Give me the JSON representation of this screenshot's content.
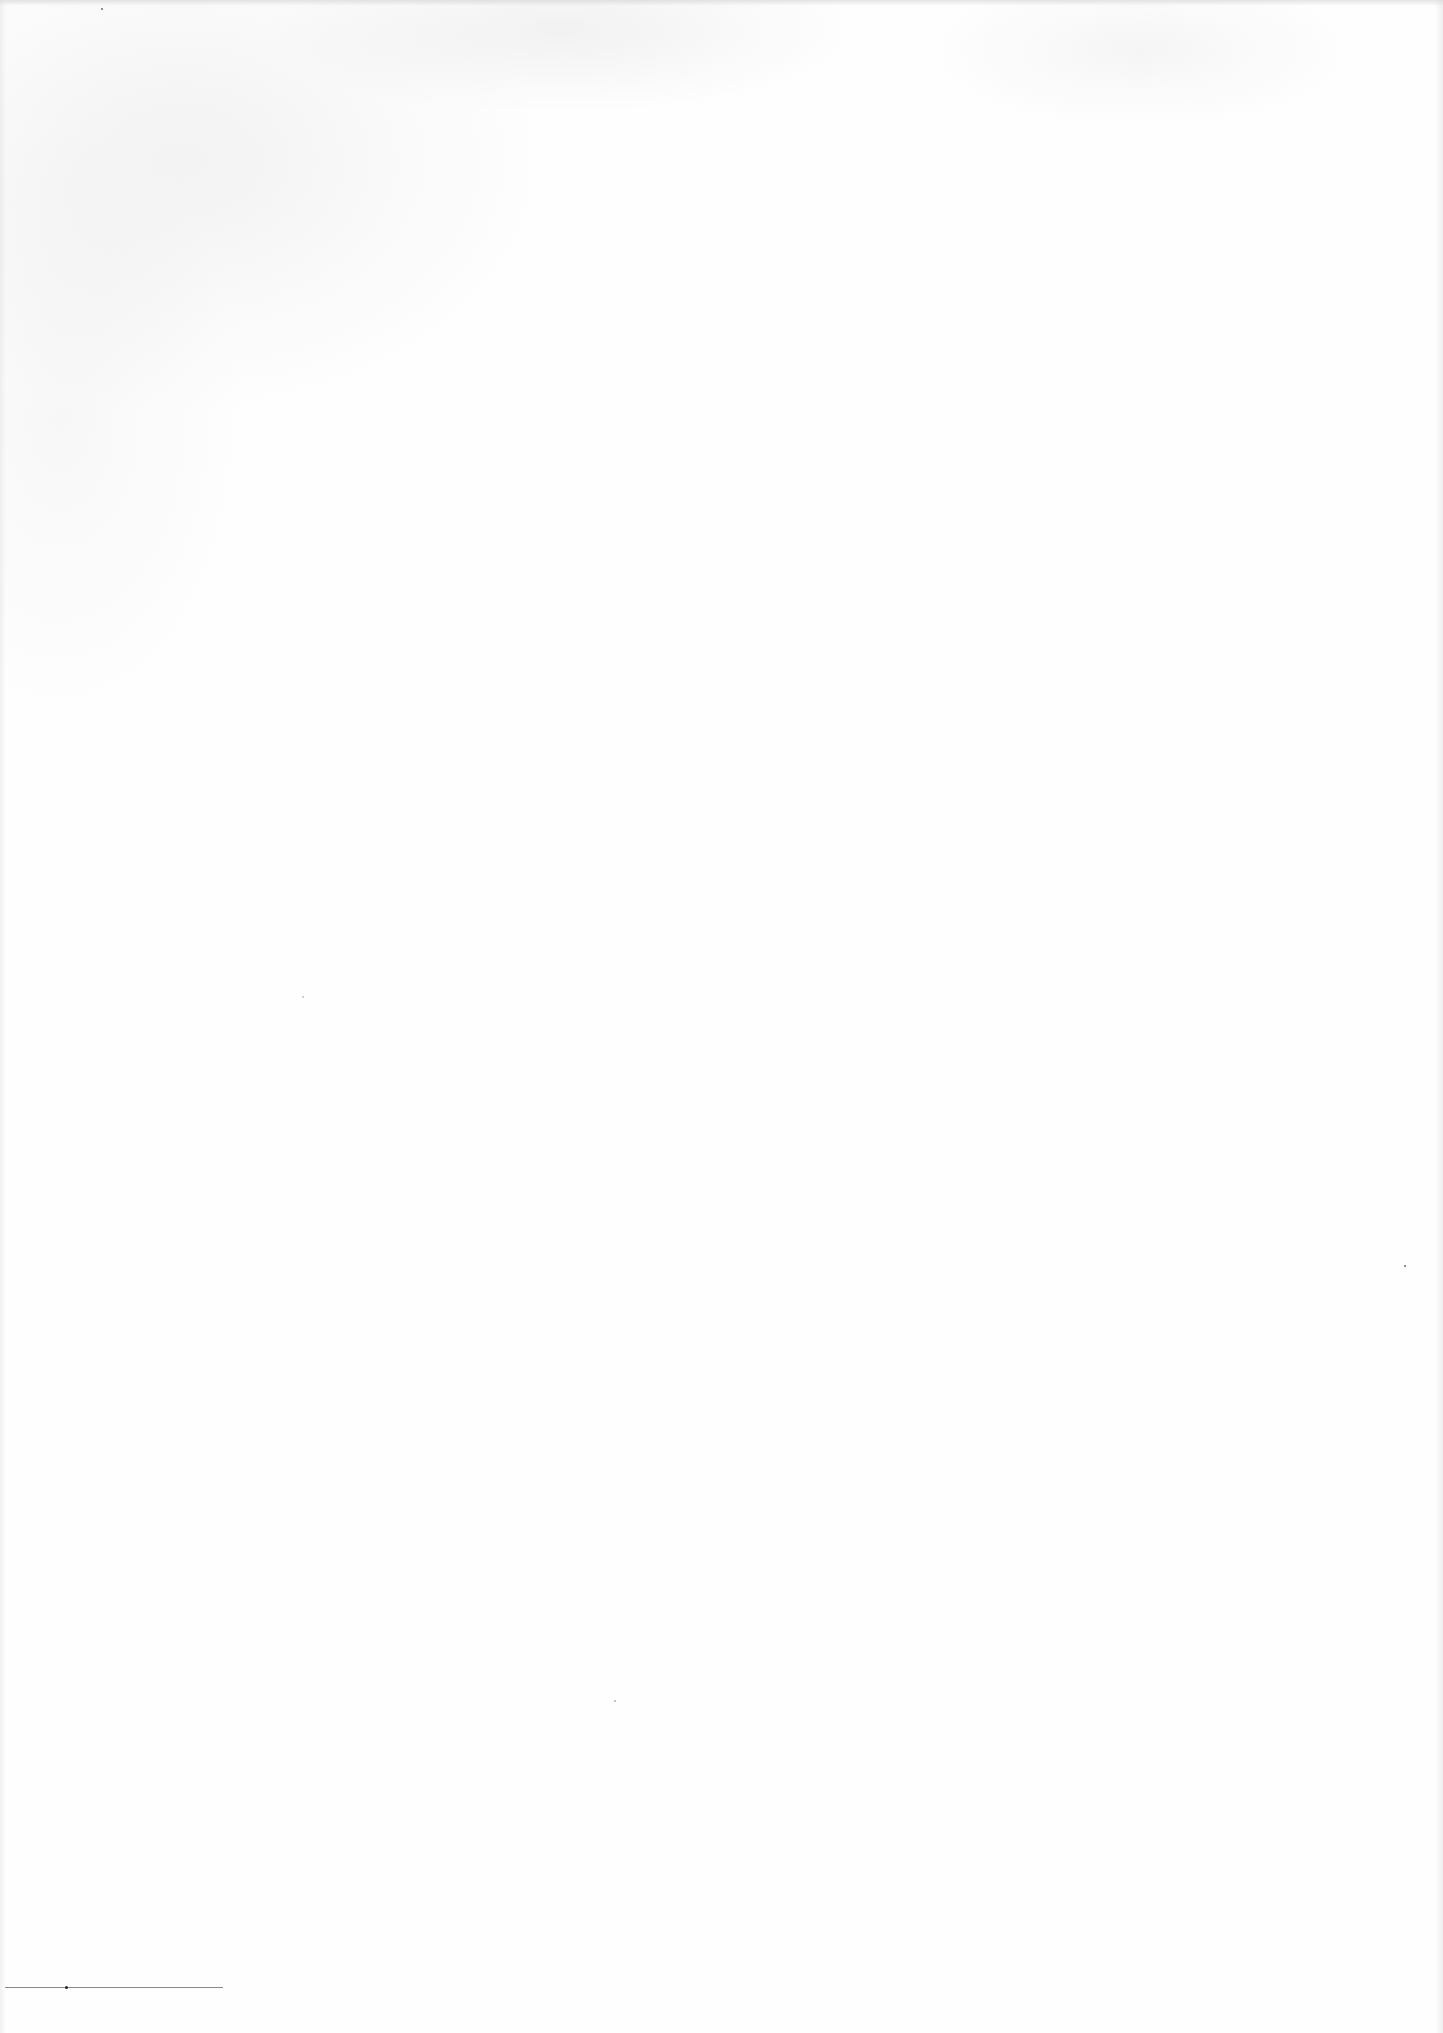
{
  "page": {
    "type": "blank-scanned-page",
    "background_color": "#fefefe",
    "text_content": [],
    "footnote_rule": {
      "present": true,
      "color": "#8a8a8a",
      "x": 5,
      "y": 1987,
      "width": 218
    }
  }
}
